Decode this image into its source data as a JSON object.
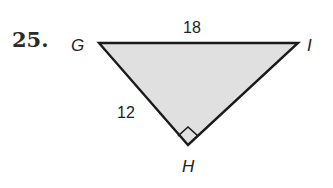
{
  "problem": {
    "number": "25."
  },
  "triangle": {
    "fill_color": "#e0e0e0",
    "stroke_color": "#1a1a1a",
    "vertices": [
      {
        "name": "G",
        "label": "G"
      },
      {
        "name": "H",
        "label": "H"
      },
      {
        "name": "I",
        "label": "I"
      }
    ],
    "sides": [
      {
        "between": "GI",
        "label": "18"
      },
      {
        "between": "GH",
        "label": "12"
      }
    ],
    "right_angle_at": "H"
  }
}
